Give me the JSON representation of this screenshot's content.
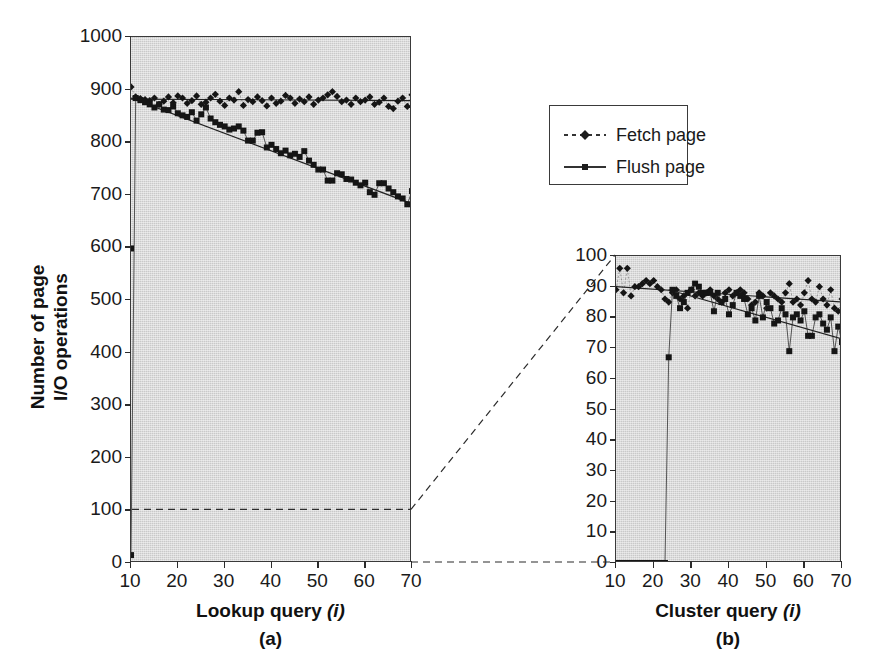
{
  "figure": {
    "y_axis_title_line1": "Number of page",
    "y_axis_title_line2": "I/O operations"
  },
  "legend": {
    "position": "top-right",
    "entries": [
      {
        "label": "Fetch page",
        "marker": "diamond",
        "line": "dashed"
      },
      {
        "label": "Flush page",
        "marker": "square",
        "line": "solid"
      }
    ]
  },
  "chart_data": [
    {
      "type": "scatter",
      "panel": "a",
      "panel_letter": "(a)",
      "title": "",
      "xlabel": "Lookup query (i)",
      "xlabel_plain": "Lookup query",
      "xlabel_italic": "(i)",
      "ylabel": "Number of page I/O operations",
      "xlim": [
        10,
        70
      ],
      "ylim": [
        0,
        1000
      ],
      "xticks": [
        10,
        20,
        30,
        40,
        50,
        60,
        70
      ],
      "yticks": [
        0,
        100,
        200,
        300,
        400,
        500,
        600,
        700,
        800,
        900,
        1000
      ],
      "grid": false,
      "series": [
        {
          "name": "Fetch page",
          "marker": "diamond",
          "trend": {
            "type": "linear",
            "x": [
              10,
              70
            ],
            "y": [
              882,
              879
            ]
          },
          "x": [
            10,
            11,
            12,
            13,
            14,
            15,
            16,
            17,
            18,
            19,
            20,
            21,
            22,
            23,
            24,
            25,
            26,
            27,
            28,
            29,
            30,
            31,
            32,
            33,
            34,
            35,
            36,
            37,
            38,
            39,
            40,
            41,
            42,
            43,
            44,
            45,
            46,
            47,
            48,
            49,
            50,
            51,
            52,
            53,
            54,
            55,
            56,
            57,
            58,
            59,
            60,
            61,
            62,
            63,
            64,
            65,
            66,
            67,
            68,
            69,
            70
          ],
          "y": [
            905,
            886,
            883,
            881,
            879,
            884,
            872,
            878,
            886,
            875,
            888,
            884,
            874,
            879,
            888,
            872,
            876,
            884,
            891,
            878,
            870,
            884,
            880,
            896,
            870,
            881,
            877,
            886,
            879,
            869,
            884,
            874,
            878,
            889,
            884,
            874,
            882,
            877,
            886,
            872,
            880,
            884,
            890,
            896,
            887,
            877,
            880,
            872,
            884,
            877,
            880,
            886,
            872,
            876,
            884,
            868,
            864,
            878,
            884,
            868,
            890
          ]
        },
        {
          "name": "Flush page",
          "marker": "square",
          "trend": {
            "type": "linear",
            "x": [
              10,
              70
            ],
            "y": [
              884,
              683
            ]
          },
          "x": [
            10,
            11,
            12,
            13,
            14,
            15,
            16,
            17,
            18,
            19,
            20,
            21,
            22,
            23,
            24,
            25,
            26,
            27,
            28,
            29,
            30,
            31,
            32,
            33,
            34,
            35,
            36,
            37,
            38,
            39,
            40,
            41,
            42,
            43,
            44,
            45,
            46,
            47,
            48,
            49,
            50,
            51,
            52,
            53,
            54,
            55,
            56,
            57,
            58,
            59,
            60,
            61,
            62,
            63,
            64,
            65,
            66,
            67,
            68,
            69,
            70
          ],
          "y": [
            15,
            884,
            880,
            876,
            872,
            866,
            872,
            862,
            861,
            868,
            855,
            851,
            848,
            857,
            841,
            853,
            866,
            845,
            838,
            833,
            830,
            824,
            826,
            830,
            822,
            803,
            803,
            818,
            819,
            790,
            795,
            787,
            779,
            784,
            775,
            778,
            772,
            783,
            765,
            757,
            748,
            748,
            727,
            727,
            741,
            739,
            730,
            729,
            723,
            718,
            723,
            705,
            700,
            722,
            722,
            712,
            705,
            697,
            693,
            682,
            707
          ],
          "outliers": [
            {
              "x": 10,
              "y": 598,
              "note": "single low flush outlier"
            }
          ]
        }
      ],
      "callout_level": 100
    },
    {
      "type": "scatter",
      "panel": "b",
      "panel_letter": "(b)",
      "title": "",
      "xlabel": "Cluster query (i)",
      "xlabel_plain": "Cluster query",
      "xlabel_italic": "(i)",
      "ylabel": "",
      "xlim": [
        10,
        70
      ],
      "ylim": [
        0,
        100
      ],
      "xticks": [
        10,
        20,
        30,
        40,
        50,
        60,
        70
      ],
      "yticks": [
        0,
        10,
        20,
        30,
        40,
        50,
        60,
        70,
        80,
        90,
        100
      ],
      "grid": false,
      "series": [
        {
          "name": "Fetch page",
          "marker": "diamond",
          "trend": {
            "type": "linear",
            "x": [
              10,
              70
            ],
            "y": [
              90,
              85
            ]
          },
          "x": [
            10,
            11,
            12,
            13,
            14,
            15,
            16,
            17,
            18,
            19,
            20,
            21,
            22,
            23,
            24,
            25,
            26,
            27,
            28,
            29,
            30,
            31,
            32,
            33,
            34,
            35,
            36,
            37,
            38,
            39,
            40,
            41,
            42,
            43,
            44,
            45,
            46,
            47,
            48,
            49,
            50,
            51,
            52,
            53,
            54,
            55,
            56,
            57,
            58,
            59,
            60,
            61,
            62,
            63,
            64,
            65,
            66,
            67,
            68,
            69,
            70
          ],
          "y": [
            89,
            96,
            88,
            96,
            87,
            90,
            90,
            91,
            92,
            91,
            92,
            90,
            89,
            86,
            85,
            88,
            89,
            86,
            87,
            83,
            89,
            87,
            88,
            87,
            88,
            89,
            87,
            86,
            85,
            88,
            89,
            87,
            88,
            89,
            88,
            86,
            84,
            85,
            88,
            87,
            83,
            88,
            87,
            86,
            85,
            88,
            91,
            85,
            86,
            84,
            88,
            92,
            86,
            85,
            90,
            86,
            84,
            89,
            83,
            82,
            86
          ]
        },
        {
          "name": "Flush page",
          "marker": "square",
          "trend": {
            "type": "linear",
            "x": [
              24,
              70
            ],
            "y": [
              89,
              73
            ]
          },
          "baseline_zero_until": 24,
          "x": [
            10,
            11,
            12,
            13,
            14,
            15,
            16,
            17,
            18,
            19,
            20,
            21,
            22,
            23,
            24,
            25,
            26,
            27,
            28,
            29,
            30,
            31,
            32,
            33,
            34,
            35,
            36,
            37,
            38,
            39,
            40,
            41,
            42,
            43,
            44,
            45,
            46,
            47,
            48,
            49,
            50,
            51,
            52,
            53,
            54,
            55,
            56,
            57,
            58,
            59,
            60,
            61,
            62,
            63,
            64,
            65,
            66,
            67,
            68,
            69,
            70
          ],
          "y": [
            0,
            0,
            0,
            0,
            0,
            0,
            0,
            0,
            0,
            0,
            0,
            0,
            0,
            0,
            67,
            89,
            87,
            83,
            85,
            88,
            89,
            91,
            90,
            88,
            88,
            88,
            82,
            88,
            85,
            86,
            81,
            84,
            88,
            87,
            86,
            81,
            83,
            79,
            87,
            80,
            85,
            83,
            78,
            79,
            83,
            81,
            69,
            80,
            81,
            79,
            82,
            74,
            74,
            80,
            81,
            78,
            76,
            80,
            69,
            77,
            72
          ]
        }
      ]
    }
  ]
}
